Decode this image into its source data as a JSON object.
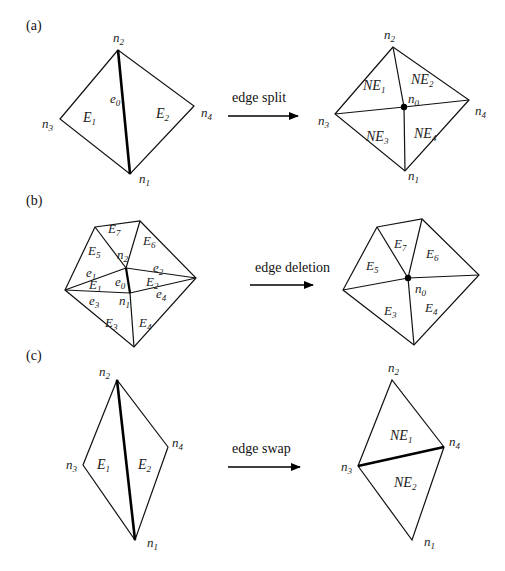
{
  "figure": {
    "panels": [
      {
        "id": "a",
        "panel_label": "(a)",
        "operation": "edge split",
        "before": {
          "nodes": {
            "n1": "n1",
            "n2": "n2",
            "n3": "n3",
            "n4": "n4"
          },
          "edge_label": "e0",
          "elements": [
            "E1",
            "E2"
          ]
        },
        "after": {
          "nodes": {
            "n0": "n0",
            "n1": "n1",
            "n2": "n2",
            "n3": "n3",
            "n4": "n4"
          },
          "elements": [
            "NE1",
            "NE2",
            "NE3",
            "NE4"
          ]
        }
      },
      {
        "id": "b",
        "panel_label": "(b)",
        "operation": "edge deletion",
        "before": {
          "nodes": {
            "n1": "n1",
            "n2": "n2"
          },
          "edges": [
            "e0",
            "e1",
            "e2",
            "e3",
            "e4"
          ],
          "elements": [
            "E1",
            "E2",
            "E3",
            "E4",
            "E5",
            "E6",
            "E7"
          ]
        },
        "after": {
          "nodes": {
            "n0": "n0"
          },
          "elements": [
            "E3",
            "E4",
            "E5",
            "E6",
            "E7"
          ]
        }
      },
      {
        "id": "c",
        "panel_label": "(c)",
        "operation": "edge swap",
        "before": {
          "nodes": {
            "n1": "n1",
            "n2": "n2",
            "n3": "n3",
            "n4": "n4"
          },
          "elements": [
            "E1",
            "E2"
          ]
        },
        "after": {
          "nodes": {
            "n1": "n1",
            "n2": "n2",
            "n3": "n3",
            "n4": "n4"
          },
          "elements": [
            "NE1",
            "NE2"
          ]
        }
      }
    ],
    "colors": {
      "line": "#111111",
      "background": "#ffffff",
      "text": "#222222"
    }
  }
}
